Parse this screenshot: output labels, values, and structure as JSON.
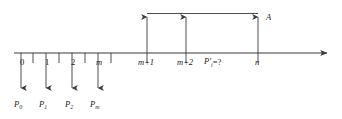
{
  "figure": {
    "type": "cash-flow-timeline",
    "background_color": "#ffffff",
    "line_color": "#3a3a3a",
    "text_color": "#1a1a1a",
    "axis": {
      "label": "time-axis",
      "start_x": 14,
      "end_x": 332,
      "y": 53,
      "has_right_arrowhead": true
    },
    "period_labels": [
      {
        "text": "0",
        "x": 20,
        "italic": false
      },
      {
        "text": "1",
        "x": 45,
        "italic": false
      },
      {
        "text": "2",
        "x": 71,
        "italic": false
      },
      {
        "text": "m",
        "x": 96,
        "italic": true
      },
      {
        "text": "m+1",
        "x": 139,
        "italic": true
      },
      {
        "text": "m+2",
        "x": 179,
        "italic": true
      },
      {
        "text": "n",
        "x": 255,
        "italic": true
      }
    ],
    "unknown_label": {
      "name": "unknown-payment-label",
      "base": "P",
      "prime": "′",
      "subscript": "i",
      "equals": "=",
      "value": "?",
      "full_text": "P′i=?",
      "x": 204,
      "y": 58
    },
    "annuity_label": {
      "name": "annuity-label",
      "text": "A",
      "x": 266,
      "y": 13
    },
    "outflows": [
      {
        "name": "payment-arrow-0",
        "x": 21,
        "label": "P",
        "subscript": "0",
        "label_x": 14,
        "label_y": 100
      },
      {
        "name": "payment-arrow-1",
        "x": 46,
        "label": "P",
        "subscript": "1",
        "label_x": 39,
        "label_y": 100
      },
      {
        "name": "payment-arrow-2",
        "x": 72,
        "label": "P",
        "subscript": "2",
        "label_x": 65,
        "label_y": 100
      },
      {
        "name": "payment-arrow-m",
        "x": 98,
        "label": "P",
        "subscript": "m",
        "label_x": 90,
        "label_y": 100
      }
    ],
    "inflows": [
      {
        "name": "annuity-arrow-m-plus-1",
        "x": 147
      },
      {
        "name": "annuity-arrow-m-plus-2",
        "x": 186
      },
      {
        "name": "annuity-arrow-n",
        "x": 258
      }
    ],
    "bracket": {
      "name": "annuity-bracket",
      "y": 13,
      "from_x": 147,
      "to_x": 258
    },
    "ticks": [
      {
        "x": 33,
        "from_y": 53,
        "to_y": 63
      },
      {
        "x": 59,
        "from_y": 53,
        "to_y": 63
      },
      {
        "x": 85,
        "from_y": 53,
        "to_y": 63
      },
      {
        "x": 111,
        "from_y": 53,
        "to_y": 63
      },
      {
        "x": 147,
        "from_y": 53,
        "to_y": 63
      },
      {
        "x": 186,
        "from_y": 53,
        "to_y": 63
      },
      {
        "x": 258,
        "from_y": 53,
        "to_y": 63
      }
    ]
  }
}
